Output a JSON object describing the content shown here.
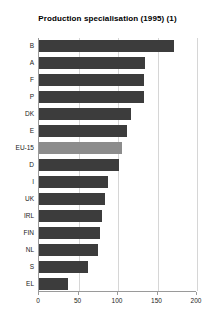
{
  "chart_data": {
    "type": "bar",
    "orientation": "horizontal",
    "title": "Production specialisation (1995) (1)",
    "xlabel": "",
    "ylabel": "",
    "xlim": [
      0,
      200
    ],
    "xticks": [
      0,
      50,
      100,
      150,
      200
    ],
    "grid": "vertical",
    "legend": "none",
    "categories": [
      "B",
      "A",
      "F",
      "P",
      "DK",
      "E",
      "EU-15",
      "D",
      "I",
      "UK",
      "IRL",
      "FIN",
      "NL",
      "S",
      "EL"
    ],
    "values": [
      171,
      134,
      133,
      133,
      117,
      112,
      105,
      101,
      87,
      84,
      80,
      77,
      75,
      62,
      37
    ],
    "highlight_category": "EU-15",
    "colors": {
      "bar": "#3c3c3c",
      "bar_highlight": "#8c8c8c",
      "grid": "#d6d6d6",
      "axis": "#9a9a9a",
      "text": "#1a1a1a",
      "background": "#ffffff"
    }
  }
}
